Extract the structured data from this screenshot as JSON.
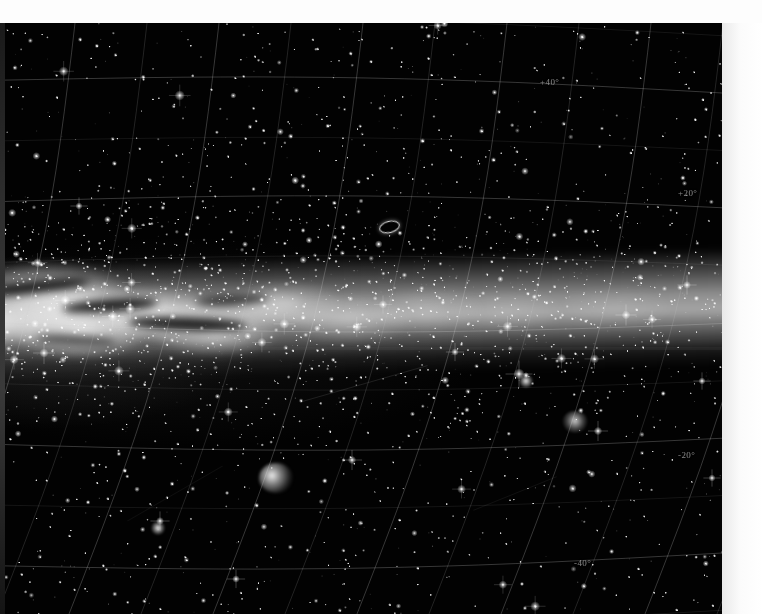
{
  "view": {
    "title": "Milky Way galactic centre photographic sky survey plate",
    "plate_background_color": "#020202",
    "margin_color": "#fdfdfd",
    "grid_color": "#cfcfcf",
    "label_color": "#d8d8d8",
    "width": 762,
    "height": 614
  },
  "coordinate_labels": [
    {
      "text": "+40°",
      "x": 540,
      "y": 77,
      "name": "dec-label-plus-40"
    },
    {
      "text": "+20°",
      "x": 678,
      "y": 188,
      "name": "dec-label-plus-20"
    },
    {
      "text": "-20°",
      "x": 678,
      "y": 450,
      "name": "dec-label-minus-20"
    },
    {
      "text": "-40°",
      "x": 574,
      "y": 558,
      "name": "dec-label-minus-40"
    }
  ],
  "objects": [
    {
      "name": "ring-galaxy-marking",
      "kind": "dso-ring",
      "x": 379,
      "y": 221,
      "label": "elliptical ring feature"
    },
    {
      "name": "emission-nebula",
      "kind": "dso-nebula",
      "x": 259,
      "y": 463,
      "label": "bright emission nebula"
    },
    {
      "name": "open-cluster",
      "kind": "dso-cluster",
      "x": 562,
      "y": 411,
      "label": "open star cluster"
    },
    {
      "name": "globular-cluster",
      "kind": "dso-globular",
      "x": 151,
      "y": 521,
      "label": "globular cluster"
    },
    {
      "name": "bright-star-primary",
      "kind": "dso-globular",
      "x": 519,
      "y": 374,
      "label": "bright field star"
    }
  ],
  "chart_data": {
    "type": "scatter",
    "xlabel": "Galactic longitude (curved grid)",
    "ylabel": "Declination",
    "grid": true,
    "legend": "none",
    "dec_ticks": [
      "+40°",
      "+20°",
      "-20°",
      "-40°"
    ],
    "dec_tick_values": [
      40,
      20,
      -20,
      -40
    ],
    "ylim": [
      -50,
      50
    ]
  }
}
